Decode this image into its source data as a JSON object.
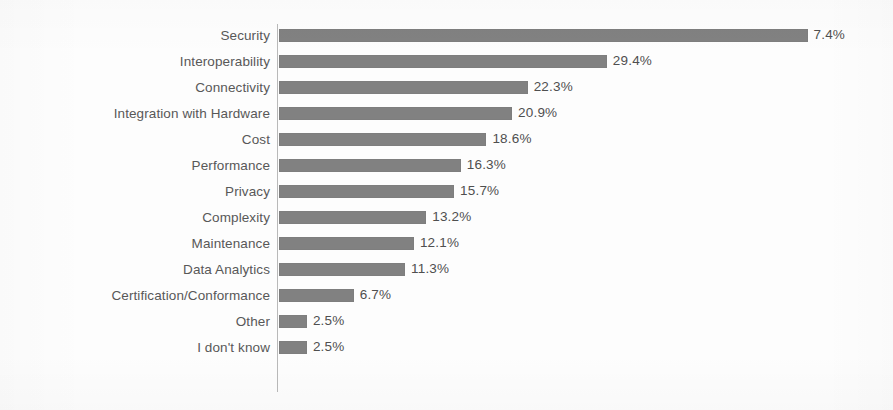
{
  "chart_data": {
    "type": "bar",
    "orientation": "horizontal",
    "title": "",
    "subtitle": "",
    "xlabel": "",
    "ylabel": "",
    "grid": false,
    "legend": false,
    "legend_position": "none",
    "axis_tick_labels": [],
    "xlim": [
      0,
      50
    ],
    "value_suffix": "%",
    "bar_color": "#818181",
    "label_color": "#585858",
    "value_label_color": "#4f4f4f",
    "axis_color": "#b9b9b9",
    "background_color": "#fdfdfd",
    "categories": [
      "Security",
      "Interoperability",
      "Connectivity",
      "Integration with Hardware",
      "Cost",
      "Performance",
      "Privacy",
      "Complexity",
      "Maintenance",
      "Data Analytics",
      "Certification/Conformance",
      "Other",
      "I don't know"
    ],
    "values": [
      47.4,
      29.4,
      22.3,
      20.9,
      18.6,
      16.3,
      15.7,
      13.2,
      12.1,
      11.3,
      6.7,
      2.5,
      2.5
    ],
    "value_labels": [
      "7.4%",
      "29.4%",
      "22.3%",
      "20.9%",
      "18.6%",
      "16.3%",
      "15.7%",
      "13.2%",
      "12.1%",
      "11.3%",
      "6.7%",
      "2.5%",
      "2.5%"
    ],
    "bars": [
      {
        "label": "Security",
        "value": 47.4,
        "value_label": "7.4%"
      },
      {
        "label": "Interoperability",
        "value": 29.4,
        "value_label": "29.4%"
      },
      {
        "label": "Connectivity",
        "value": 22.3,
        "value_label": "22.3%"
      },
      {
        "label": "Integration with Hardware",
        "value": 20.9,
        "value_label": "20.9%"
      },
      {
        "label": "Cost",
        "value": 18.6,
        "value_label": "18.6%"
      },
      {
        "label": "Performance",
        "value": 16.3,
        "value_label": "16.3%"
      },
      {
        "label": "Privacy",
        "value": 15.7,
        "value_label": "15.7%"
      },
      {
        "label": "Complexity",
        "value": 13.2,
        "value_label": "13.2%"
      },
      {
        "label": "Maintenance",
        "value": 12.1,
        "value_label": "12.1%"
      },
      {
        "label": "Data Analytics",
        "value": 11.3,
        "value_label": "11.3%"
      },
      {
        "label": "Certification/Conformance",
        "value": 6.7,
        "value_label": "6.7%"
      },
      {
        "label": "Other",
        "value": 2.5,
        "value_label": "2.5%"
      },
      {
        "label": "I don't know",
        "value": 2.5,
        "value_label": "2.5%"
      }
    ]
  },
  "layout": {
    "axis_x": 277,
    "bar_origin_x": 279,
    "first_row_y": 27,
    "row_pitch": 26,
    "bar_height": 13,
    "px_per_percent": 11.15,
    "value_gap": 6
  }
}
